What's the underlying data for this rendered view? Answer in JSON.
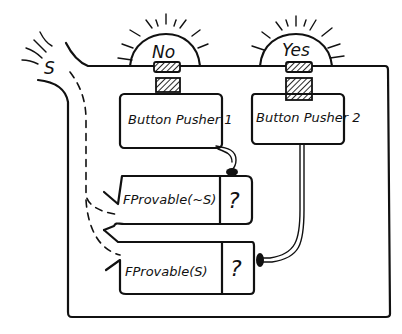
{
  "diagram": {
    "style": "hand-drawn",
    "ink_color": "#111111",
    "background": "#ffffff",
    "signal": {
      "label": "S",
      "icon": "radiating-lines"
    },
    "lights": [
      {
        "label": "No",
        "icon": "lamp-dome-with-rays"
      },
      {
        "label": "Yes",
        "icon": "lamp-dome-with-rays"
      }
    ],
    "button_pushers": [
      {
        "label": "Button Pusher 1"
      },
      {
        "label": "Button Pusher 2"
      }
    ],
    "provers": [
      {
        "label": "FProvable(~S)",
        "result": "?"
      },
      {
        "label": "FProvable(S)",
        "result": "?"
      }
    ],
    "connections": [
      {
        "from": "S",
        "to": "FProvable(~S)",
        "style": "dashed"
      },
      {
        "from": "S",
        "to": "FProvable(S)",
        "style": "dashed"
      },
      {
        "from": "FProvable(~S)",
        "to": "Button Pusher 1",
        "style": "cable"
      },
      {
        "from": "FProvable(S)",
        "to": "Button Pusher 2",
        "style": "cable"
      },
      {
        "from": "Button Pusher 1",
        "to": "No",
        "style": "button"
      },
      {
        "from": "Button Pusher 2",
        "to": "Yes",
        "style": "button"
      }
    ]
  }
}
